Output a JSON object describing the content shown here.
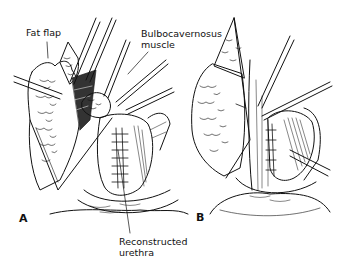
{
  "figure": {
    "panels": [
      {
        "id": "A",
        "letter": "A"
      },
      {
        "id": "B",
        "letter": "B"
      }
    ],
    "labels": {
      "fat_flap": "Fat flap",
      "bulbocavernosus_line1": "Bulbocavernosus",
      "bulbocavernosus_line2": "muscle",
      "reconstructed_line1": "Reconstructed",
      "reconstructed_line2": "urethra"
    },
    "colors": {
      "ink": "#111111",
      "background": "#ffffff"
    }
  }
}
